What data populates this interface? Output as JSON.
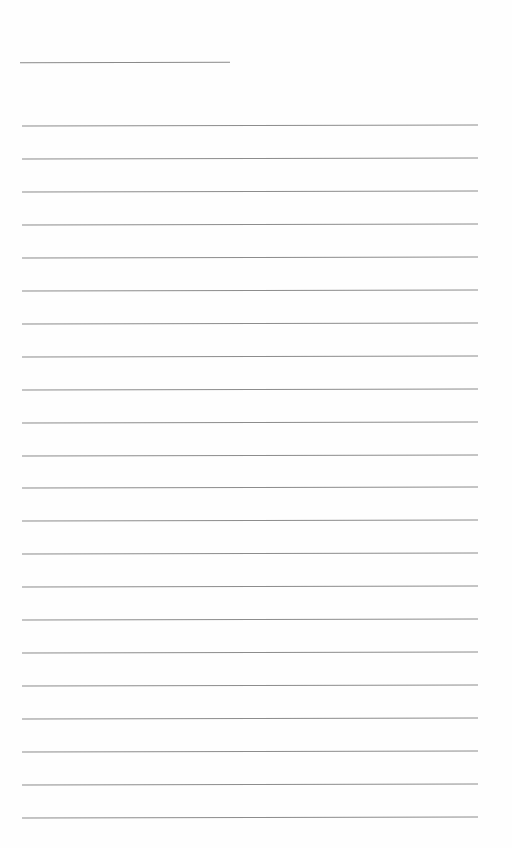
{
  "page": {
    "type": "lined-notepaper",
    "background": "#fefefe",
    "line_color": "#8c8c8c",
    "short_line": {
      "x": 20,
      "y": 62,
      "width": 210
    },
    "rules": {
      "count": 22,
      "first_y": 125,
      "spacing": 32.95,
      "x_start": 22,
      "width": 456
    }
  }
}
